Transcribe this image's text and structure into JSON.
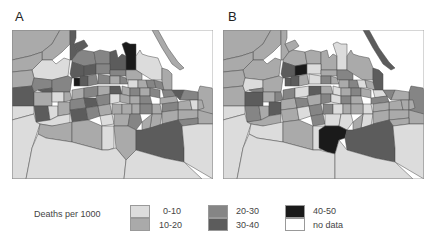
{
  "figure": {
    "panels": [
      {
        "id": "A",
        "label": "A"
      },
      {
        "id": "B",
        "label": "B"
      }
    ]
  },
  "legend": {
    "title": "Deaths per 1000",
    "classes": [
      {
        "key": "c0",
        "label": "0-10",
        "color": "#dcdcdc"
      },
      {
        "key": "c1",
        "label": "10-20",
        "color": "#aaaaaa"
      },
      {
        "key": "c2",
        "label": "20-30",
        "color": "#858585"
      },
      {
        "key": "c3",
        "label": "30-40",
        "color": "#5c5c5c"
      },
      {
        "key": "c4",
        "label": "40-50",
        "color": "#1a1a1a"
      },
      {
        "key": "nd",
        "label": "no data",
        "color": "#ffffff"
      }
    ]
  },
  "maps": {
    "A": {
      "regions": [
        {
          "pts": "0,0 48,0 40,14 30,22 18,26 0,30",
          "c": "c1"
        },
        {
          "pts": "48,0 58,0 58,14 50,22 40,30 30,30 30,22 40,14",
          "c": "c1"
        },
        {
          "pts": "0,30 18,26 30,22 30,30 20,40 0,42",
          "c": "c1"
        },
        {
          "pts": "20,40 30,30 40,30 44,34 52,28 58,30 56,46 40,50 22,48",
          "c": "c0"
        },
        {
          "pts": "0,42 20,40 22,48 20,56 0,58",
          "c": "c1"
        },
        {
          "pts": "0,58 20,56 22,62 22,76 0,76",
          "c": "c3"
        },
        {
          "pts": "58,0 64,0 64,8 62,14 66,22 60,30 58,30 58,14",
          "c": "c3"
        },
        {
          "pts": "62,14 72,10 76,16 70,20 66,22",
          "c": "c3"
        },
        {
          "pts": "66,22 70,20 82,22 84,34 72,36 60,32 60,30",
          "c": "c2"
        },
        {
          "pts": "82,22 88,20 98,22 98,34 84,34",
          "c": "c2"
        },
        {
          "pts": "98,22 104,20 106,28 110,24 114,26 114,40 98,40",
          "c": "c3"
        },
        {
          "pts": "110,14 114,12 118,14 124,14 124,40 114,40 114,26",
          "c": "c4"
        },
        {
          "pts": "124,26 128,20 130,24 136,26 146,28 150,38 150,50 140,50 124,40",
          "c": "c0"
        },
        {
          "pts": "150,38 156,40 160,44 160,60 150,60 150,50",
          "c": "c1"
        },
        {
          "pts": "140,0 146,0 156,18 166,32 172,38 168,40 160,34 150,18",
          "c": "c1"
        },
        {
          "pts": "188,56 200,58 201,60 201,84 186,84 186,62",
          "c": "c1"
        },
        {
          "pts": "22,48 40,50 40,58 26,60 22,62 20,56",
          "c": "c2"
        },
        {
          "pts": "40,50 56,46 60,48 58,62 40,62 40,58",
          "c": "c2"
        },
        {
          "pts": "60,32 72,36 72,46 62,48 60,48 58,44",
          "c": "c3"
        },
        {
          "pts": "72,36 84,34 84,44 72,46",
          "c": "c3"
        },
        {
          "pts": "84,34 98,34 98,40 98,44 84,44",
          "c": "c2"
        },
        {
          "pts": "98,40 114,40 114,46 98,46",
          "c": "c2"
        },
        {
          "pts": "114,40 124,40 130,44 130,50 114,50 114,46",
          "c": "c1"
        },
        {
          "pts": "62,48 68,48 68,56 62,56",
          "c": "c4"
        },
        {
          "pts": "68,46 76,46 76,56 68,56",
          "c": "c3"
        },
        {
          "pts": "76,46 84,44 86,54 76,56",
          "c": "c2"
        },
        {
          "pts": "86,44 98,46 98,54 86,54",
          "c": "c2"
        },
        {
          "pts": "98,46 108,46 108,54 98,54",
          "c": "c1"
        },
        {
          "pts": "108,46 114,48 116,54 108,54",
          "c": "c2"
        },
        {
          "pts": "116,50 126,50 126,58 116,58",
          "c": "c0"
        },
        {
          "pts": "126,50 134,50 136,58 126,58",
          "c": "c1"
        },
        {
          "pts": "134,50 142,50 144,58 136,58",
          "c": "c2"
        },
        {
          "pts": "142,50 150,52 152,60 144,58",
          "c": "c2"
        },
        {
          "pts": "150,60 160,60 164,66 152,68",
          "c": "c2"
        },
        {
          "pts": "160,60 172,60 168,70 164,66",
          "c": "c3"
        },
        {
          "pts": "172,60 186,62 186,70 168,70",
          "c": "c2"
        },
        {
          "pts": "22,62 40,62 40,76 22,76",
          "c": "c1"
        },
        {
          "pts": "26,60 40,58 40,62 30,62",
          "c": "c3"
        },
        {
          "pts": "40,62 52,62 52,72 40,72",
          "c": "c0"
        },
        {
          "pts": "52,62 58,62 60,70 52,72",
          "c": "c1"
        },
        {
          "pts": "60,60 72,58 72,68 60,70",
          "c": "c1"
        },
        {
          "pts": "72,58 86,56 86,66 72,68",
          "c": "c2"
        },
        {
          "pts": "86,56 98,56 98,64 86,66",
          "c": "c1"
        },
        {
          "pts": "98,56 108,56 110,64 98,64",
          "c": "c3"
        },
        {
          "pts": "110,56 118,58 118,66 110,64",
          "c": "c1"
        },
        {
          "pts": "118,58 128,58 128,66 118,66",
          "c": "c2"
        },
        {
          "pts": "128,58 138,58 138,66 128,66",
          "c": "c1"
        },
        {
          "pts": "138,58 148,60 148,68 138,66",
          "c": "c2"
        },
        {
          "pts": "148,68 164,66 166,72 148,74",
          "c": "c1"
        },
        {
          "pts": "166,72 178,70 180,80 166,80",
          "c": "c1"
        },
        {
          "pts": "178,70 186,70 186,80 180,80",
          "c": "c0"
        },
        {
          "pts": "186,70 190,70 192,78 186,80",
          "c": "c1"
        },
        {
          "pts": "0,76 22,76 22,84 0,90",
          "c": "c0"
        },
        {
          "pts": "22,76 36,76 38,90 30,92 24,92",
          "c": "c3"
        },
        {
          "pts": "36,76 46,76 46,86 38,90",
          "c": "c0"
        },
        {
          "pts": "46,72 58,72 58,84 46,86",
          "c": "c1"
        },
        {
          "pts": "58,70 72,68 74,78 58,80",
          "c": "c2"
        },
        {
          "pts": "72,68 84,68 86,76 74,78",
          "c": "c3"
        },
        {
          "pts": "84,66 98,64 98,74 86,76",
          "c": "c2"
        },
        {
          "pts": "98,64 108,64 108,72 98,74",
          "c": "c0"
        },
        {
          "pts": "108,64 118,66 118,74 108,72",
          "c": "c1"
        },
        {
          "pts": "118,66 128,66 128,74 118,74",
          "c": "c1"
        },
        {
          "pts": "128,66 138,66 140,74 128,74",
          "c": "c2"
        },
        {
          "pts": "140,74 148,74 150,84 140,84",
          "c": "c1"
        },
        {
          "pts": "150,74 166,72 166,80 150,82",
          "c": "c2"
        },
        {
          "pts": "166,80 186,80 186,88 166,90",
          "c": "c1"
        },
        {
          "pts": "186,80 201,84 201,94 186,94",
          "c": "c1"
        },
        {
          "pts": "24,92 38,90 46,86 58,84 58,94 40,96 28,94",
          "c": "c0"
        },
        {
          "pts": "58,80 74,78 76,90 60,92",
          "c": "c3"
        },
        {
          "pts": "74,78 86,76 88,86 76,90",
          "c": "c2"
        },
        {
          "pts": "86,76 98,74 100,84 88,86",
          "c": "c1"
        },
        {
          "pts": "100,74 110,74 110,86 100,84",
          "c": "c1"
        },
        {
          "pts": "110,74 120,74 120,84 110,86",
          "c": "c1"
        },
        {
          "pts": "120,74 128,74 128,84 120,84",
          "c": "c1"
        },
        {
          "pts": "128,74 140,74 140,84 128,84",
          "c": "c2"
        },
        {
          "pts": "140,84 150,84 148,96 138,98",
          "c": "c1"
        },
        {
          "pts": "150,82 166,80 166,90 150,94",
          "c": "c1"
        },
        {
          "pts": "166,90 186,88 186,94 170,96",
          "c": "c2"
        },
        {
          "pts": "88,86 100,84 102,94 90,96",
          "c": "c0"
        },
        {
          "pts": "102,84 118,84 116,96 102,96",
          "c": "c1"
        },
        {
          "pts": "118,84 128,84 130,92 124,100 116,96",
          "c": "c2"
        },
        {
          "pts": "130,92 140,84 138,98 130,100",
          "c": "c1"
        },
        {
          "pts": "0,90 22,84 24,92 28,94 20,118 14,149 0,149",
          "c": "c0"
        },
        {
          "pts": "28,94 40,96 60,92 60,112 34,108 26,104",
          "c": "c1"
        },
        {
          "pts": "60,92 76,90 90,96 90,120 60,112",
          "c": "c1"
        },
        {
          "pts": "90,96 102,96 102,118 96,120 90,120",
          "c": "c0"
        },
        {
          "pts": "102,96 116,96 124,100 124,120 114,130 104,118",
          "c": "c1"
        },
        {
          "pts": "130,100 138,98 150,94 166,90 170,96 172,118 172,132 152,128 124,120 124,100",
          "c": "c3"
        },
        {
          "pts": "170,96 186,94 201,94 201,149 172,132 172,118",
          "c": "c0"
        },
        {
          "pts": "26,104 34,108 60,112 90,120 96,120 104,118 114,130 112,149 14,149 20,118",
          "c": "c0"
        },
        {
          "pts": "114,130 124,120 152,128 172,132 190,149 112,149",
          "c": "c0"
        }
      ]
    },
    "B": {
      "regions": [
        {
          "pts": "0,0 48,0 40,14 30,22 18,26 0,30",
          "c": "c1"
        },
        {
          "pts": "48,0 58,0 58,14 50,22 40,30 30,30 30,22 40,14",
          "c": "c1"
        },
        {
          "pts": "0,30 18,26 30,22 30,30 20,40 0,42",
          "c": "c1"
        },
        {
          "pts": "20,40 30,30 40,30 44,34 52,28 58,30 56,46 40,50 22,48",
          "c": "c1"
        },
        {
          "pts": "0,42 20,40 22,48 20,56 0,58",
          "c": "c1"
        },
        {
          "pts": "0,58 20,56 22,62 22,76 0,76",
          "c": "c1"
        },
        {
          "pts": "58,0 64,0 64,8 62,14 66,22 60,30 58,30 58,14",
          "c": "c1"
        },
        {
          "pts": "62,14 72,10 76,16 70,20 66,22",
          "c": "c1"
        },
        {
          "pts": "66,22 70,20 82,22 84,34 72,36 60,32 60,30",
          "c": "c1"
        },
        {
          "pts": "82,22 88,20 98,22 98,34 84,34",
          "c": "c1"
        },
        {
          "pts": "98,22 104,20 106,28 110,24 114,26 114,40 98,40",
          "c": "c1"
        },
        {
          "pts": "110,14 114,12 118,14 124,14 124,40 114,40 114,26",
          "c": "c0"
        },
        {
          "pts": "124,26 128,20 130,24 136,26 146,28 150,38 150,50 140,50 124,40",
          "c": "c1"
        },
        {
          "pts": "150,38 156,40 160,44 160,60 150,60 150,50",
          "c": "c3"
        },
        {
          "pts": "140,0 146,0 156,18 166,32 172,38 168,40 160,34 150,18",
          "c": "c3"
        },
        {
          "pts": "188,56 200,58 201,60 201,84 186,84 186,62",
          "c": "c2"
        },
        {
          "pts": "22,48 40,50 40,58 26,60 22,62 20,56",
          "c": "c0"
        },
        {
          "pts": "40,50 56,46 60,48 58,62 40,62 40,58",
          "c": "c1"
        },
        {
          "pts": "60,32 72,36 72,46 62,48 60,48 58,44",
          "c": "c3"
        },
        {
          "pts": "72,36 84,34 84,44 72,46",
          "c": "c4"
        },
        {
          "pts": "84,34 98,34 98,40 98,44 84,44",
          "c": "c0"
        },
        {
          "pts": "98,40 114,40 114,46 98,46",
          "c": "c1"
        },
        {
          "pts": "114,40 124,40 130,44 130,50 114,50 114,46",
          "c": "c2"
        },
        {
          "pts": "62,48 68,48 68,56 62,56",
          "c": "c3"
        },
        {
          "pts": "68,46 76,46 76,56 68,56",
          "c": "c3"
        },
        {
          "pts": "76,46 84,44 86,54 76,56",
          "c": "c1"
        },
        {
          "pts": "86,44 98,46 98,54 86,54",
          "c": "c0"
        },
        {
          "pts": "98,46 108,46 108,54 98,54",
          "c": "c2"
        },
        {
          "pts": "108,46 114,48 116,54 108,54",
          "c": "c1"
        },
        {
          "pts": "116,50 126,50 126,58 116,58",
          "c": "c1"
        },
        {
          "pts": "126,50 134,50 136,58 126,58",
          "c": "c2"
        },
        {
          "pts": "134,50 142,50 144,58 136,58",
          "c": "c0"
        },
        {
          "pts": "142,50 150,52 152,60 144,58",
          "c": "c1"
        },
        {
          "pts": "150,60 160,60 164,66 152,68",
          "c": "c0"
        },
        {
          "pts": "160,60 172,60 168,70 164,66",
          "c": "c2"
        },
        {
          "pts": "172,60 186,62 186,70 168,70",
          "c": "c1"
        },
        {
          "pts": "22,62 40,62 40,76 22,76",
          "c": "c3"
        },
        {
          "pts": "26,60 40,58 40,62 30,62",
          "c": "c2"
        },
        {
          "pts": "40,62 52,62 52,72 40,72",
          "c": "c1"
        },
        {
          "pts": "52,62 58,62 60,70 52,72",
          "c": "c2"
        },
        {
          "pts": "60,60 72,58 72,68 60,70",
          "c": "c2"
        },
        {
          "pts": "72,58 86,56 86,66 72,68",
          "c": "c0"
        },
        {
          "pts": "86,56 98,56 98,64 86,66",
          "c": "c3"
        },
        {
          "pts": "98,56 108,56 110,64 98,64",
          "c": "c1"
        },
        {
          "pts": "110,56 118,58 118,66 110,64",
          "c": "c0"
        },
        {
          "pts": "118,58 128,58 128,66 118,66",
          "c": "c1"
        },
        {
          "pts": "128,58 138,58 138,66 128,66",
          "c": "c2"
        },
        {
          "pts": "138,58 148,60 148,68 138,66",
          "c": "c1"
        },
        {
          "pts": "148,68 164,66 166,72 148,74",
          "c": "c2"
        },
        {
          "pts": "166,72 178,70 180,80 166,80",
          "c": "c1"
        },
        {
          "pts": "178,70 186,70 186,80 180,80",
          "c": "c1"
        },
        {
          "pts": "186,70 190,70 192,78 186,80",
          "c": "c1"
        },
        {
          "pts": "0,76 22,76 22,84 0,90",
          "c": "c0"
        },
        {
          "pts": "22,76 36,76 38,90 30,92 24,92",
          "c": "c2"
        },
        {
          "pts": "36,76 46,76 46,86 38,90",
          "c": "c1"
        },
        {
          "pts": "46,72 58,72 58,84 46,86",
          "c": "c3"
        },
        {
          "pts": "58,70 72,68 74,78 58,80",
          "c": "c1"
        },
        {
          "pts": "72,68 84,68 86,76 74,78",
          "c": "c2"
        },
        {
          "pts": "84,66 98,64 98,74 86,76",
          "c": "c1"
        },
        {
          "pts": "98,64 108,64 108,72 98,74",
          "c": "c2"
        },
        {
          "pts": "108,64 118,66 118,74 108,72",
          "c": "c0"
        },
        {
          "pts": "118,66 128,66 128,74 118,74",
          "c": "c2"
        },
        {
          "pts": "128,66 138,66 140,74 128,74",
          "c": "c1"
        },
        {
          "pts": "140,74 148,74 150,84 140,84",
          "c": "c0"
        },
        {
          "pts": "150,74 166,72 166,80 150,82",
          "c": "c1"
        },
        {
          "pts": "166,80 186,80 186,88 166,90",
          "c": "c1"
        },
        {
          "pts": "186,80 201,84 201,94 186,94",
          "c": "c1"
        },
        {
          "pts": "24,92 38,90 46,86 58,84 58,94 40,96 28,94",
          "c": "c1"
        },
        {
          "pts": "58,80 74,78 76,90 60,92",
          "c": "c1"
        },
        {
          "pts": "74,78 86,76 88,86 76,90",
          "c": "c0"
        },
        {
          "pts": "86,76 98,74 100,84 88,86",
          "c": "c2"
        },
        {
          "pts": "100,74 110,74 110,86 100,84",
          "c": "c2"
        },
        {
          "pts": "110,74 120,74 120,84 110,86",
          "c": "c0"
        },
        {
          "pts": "120,74 128,74 128,84 120,84",
          "c": "c1"
        },
        {
          "pts": "128,74 140,74 140,84 128,84",
          "c": "c1"
        },
        {
          "pts": "140,84 150,84 148,96 138,98",
          "c": "c0"
        },
        {
          "pts": "150,82 166,80 166,90 150,94",
          "c": "c1"
        },
        {
          "pts": "166,90 186,88 186,94 170,96",
          "c": "c1"
        },
        {
          "pts": "88,86 100,84 102,94 90,96",
          "c": "c2"
        },
        {
          "pts": "102,84 118,84 116,96 102,96",
          "c": "c0"
        },
        {
          "pts": "118,84 128,84 130,92 124,100 116,96",
          "c": "c0"
        },
        {
          "pts": "130,92 140,84 138,98 130,100",
          "c": "c1"
        },
        {
          "pts": "0,90 22,84 24,92 28,94 20,118 14,149 0,149",
          "c": "c0"
        },
        {
          "pts": "28,94 40,96 60,92 60,112 34,108 26,104",
          "c": "c0"
        },
        {
          "pts": "60,92 76,90 90,96 90,120 60,112",
          "c": "c1"
        },
        {
          "pts": "90,96 102,96 102,118 96,120 90,120",
          "c": "c0"
        },
        {
          "pts": "96,100 102,96 116,96 124,100 122,108 116,110 112,124 104,122 96,118",
          "c": "c4"
        },
        {
          "pts": "130,100 138,98 150,94 166,90 170,96 172,118 172,132 152,128 124,120 122,108 124,100",
          "c": "c3"
        },
        {
          "pts": "170,96 186,94 201,94 201,149 172,132 172,118",
          "c": "c0"
        },
        {
          "pts": "26,104 34,108 60,112 90,120 96,120 104,122 112,124 112,149 14,149 20,118",
          "c": "c0"
        },
        {
          "pts": "112,124 116,110 124,120 152,128 172,132 190,149 112,149",
          "c": "c0"
        }
      ]
    }
  }
}
